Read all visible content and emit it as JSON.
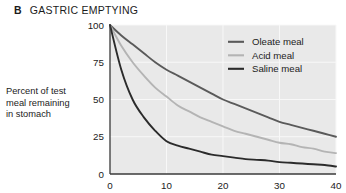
{
  "header": {
    "panel_letter": "B",
    "title": "GASTRIC EMPTYING"
  },
  "axes": {
    "ylabel_line1": "Percent of test",
    "ylabel_line2": "meal remaining",
    "ylabel_line3": "in stomach",
    "y_ticks": [
      "100",
      "75",
      "50",
      "25",
      "0"
    ],
    "x_ticks": [
      "0",
      "10",
      "20",
      "30",
      "40"
    ]
  },
  "legend": {
    "items": [
      {
        "label": "Oleate meal",
        "color": "#5a5a5a"
      },
      {
        "label": "Acid meal",
        "color": "#b4b4b4"
      },
      {
        "label": "Saline meal",
        "color": "#2b2b2b"
      }
    ]
  },
  "colors": {
    "plot_background": "#e9e9e9",
    "gridline": "#f8f8f8",
    "axis_line": "#3a3a3a",
    "text": "#1b1b1b",
    "oleate": "#5a5a5a",
    "acid": "#b4b4b4",
    "saline": "#2b2b2b"
  },
  "chart_data": {
    "type": "line",
    "title": "GASTRIC EMPTYING",
    "xlabel": "",
    "ylabel": "Percent of test meal remaining in stomach",
    "xlim": [
      0,
      40
    ],
    "ylim": [
      0,
      100
    ],
    "x_ticks": [
      0,
      10,
      20,
      30,
      40
    ],
    "y_ticks": [
      0,
      25,
      50,
      75,
      100
    ],
    "grid": true,
    "legend_position": "top-right",
    "x": [
      0,
      2,
      4,
      6,
      8,
      10,
      12,
      14,
      16,
      18,
      20,
      22,
      24,
      26,
      28,
      30,
      32,
      34,
      36,
      38,
      40
    ],
    "series": [
      {
        "name": "Oleate meal",
        "color": "#5a5a5a",
        "values": [
          100,
          93,
          87,
          81,
          75,
          70,
          66,
          62,
          58,
          54,
          50,
          47,
          44,
          41,
          38,
          35,
          33,
          31,
          29,
          27,
          25
        ]
      },
      {
        "name": "Acid meal",
        "color": "#b4b4b4",
        "values": [
          100,
          86,
          75,
          66,
          58,
          52,
          46,
          42,
          38,
          35,
          32,
          29,
          27,
          25,
          23,
          21,
          20,
          18,
          17,
          15,
          14
        ]
      },
      {
        "name": "Saline meal",
        "color": "#2b2b2b",
        "values": [
          100,
          70,
          50,
          38,
          29,
          22,
          19,
          17,
          15,
          13,
          12,
          11,
          10,
          9.5,
          9,
          8,
          7.5,
          7,
          6.5,
          6,
          5
        ]
      }
    ]
  }
}
